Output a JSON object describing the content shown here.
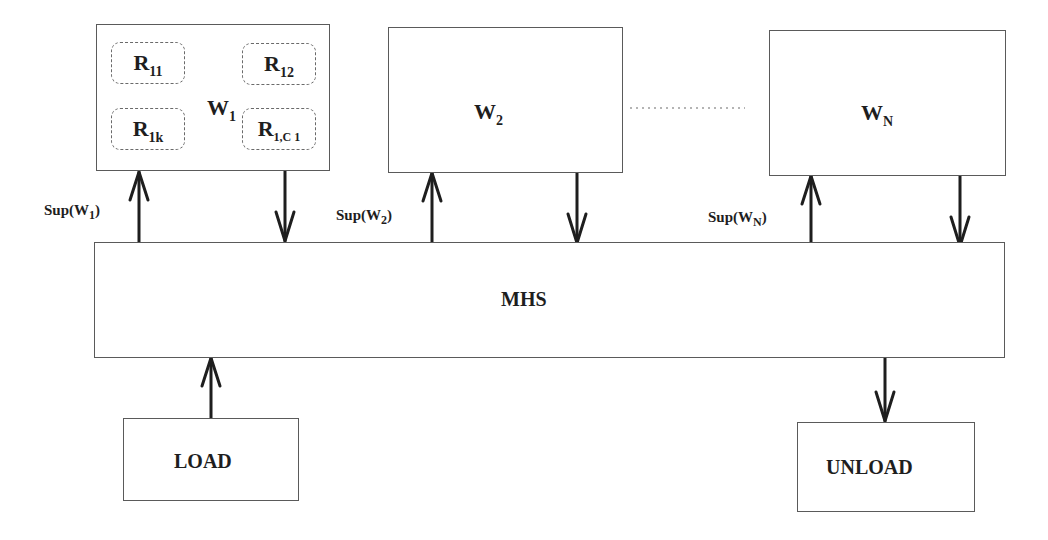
{
  "workstations": [
    {
      "id": "W1",
      "name": "W",
      "subscript": "1",
      "resources": [
        {
          "name": "R",
          "subscript": "11"
        },
        {
          "name": "R",
          "subscript": "12"
        },
        {
          "name": "R",
          "subscript": "1k"
        },
        {
          "name": "R",
          "subscript": "1,C 1"
        }
      ],
      "supply_label": {
        "prefix": "Sup(W",
        "subscript": "1",
        "suffix": ")"
      }
    },
    {
      "id": "W2",
      "name": "W",
      "subscript": "2",
      "supply_label": {
        "prefix": "Sup(W",
        "subscript": "2",
        "suffix": ")"
      }
    },
    {
      "id": "WN",
      "name": "W",
      "subscript": "N",
      "supply_label": {
        "prefix": "Sup(W",
        "subscript": "N",
        "suffix": ")"
      }
    }
  ],
  "ellipsis": "dotted-line",
  "mhs": {
    "label": "MHS"
  },
  "load": {
    "label": "LOAD"
  },
  "unload": {
    "label": "UNLOAD"
  },
  "colors": {
    "stroke": "#5a5a5a",
    "arrow": "#1e1e1e",
    "text": "#1e1e1e",
    "background": "#ffffff"
  }
}
